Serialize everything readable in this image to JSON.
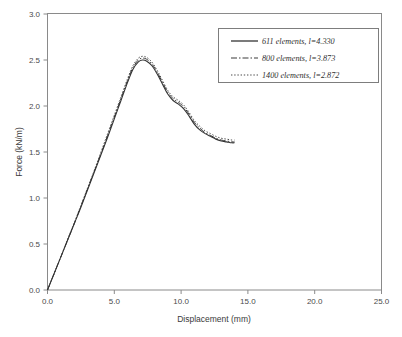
{
  "chart_data": {
    "type": "line",
    "title": "",
    "xlabel": "Displacement (mm)",
    "ylabel": "Force (kN/m)",
    "xlim": [
      0.0,
      25.0
    ],
    "ylim": [
      0.0,
      3.0
    ],
    "xticks": [
      "0.0",
      "5.0",
      "10.0",
      "15.0",
      "20.0",
      "25.0"
    ],
    "yticks": [
      "0.0",
      "0.5",
      "1.0",
      "1.5",
      "2.0",
      "2.5",
      "3.0"
    ],
    "xtick_values": [
      0.0,
      5.0,
      10.0,
      15.0,
      20.0,
      25.0
    ],
    "ytick_values": [
      0.0,
      0.5,
      1.0,
      1.5,
      2.0,
      2.5,
      3.0
    ],
    "grid": false,
    "legend_position": "top-right",
    "series": [
      {
        "name": "611 elements,  l=4.330",
        "style": "solid",
        "x": [
          0.0,
          0.5,
          1.0,
          1.5,
          2.0,
          2.5,
          3.0,
          3.5,
          4.0,
          4.5,
          5.0,
          5.5,
          6.0,
          6.4,
          6.8,
          7.1,
          7.4,
          7.8,
          8.2,
          8.6,
          9.0,
          9.4,
          9.8,
          10.2,
          10.6,
          11.0,
          11.4,
          11.8,
          12.2,
          12.6,
          13.0,
          13.4,
          13.8,
          14.0
        ],
        "y": [
          0.0,
          0.18,
          0.36,
          0.54,
          0.72,
          0.9,
          1.09,
          1.28,
          1.47,
          1.66,
          1.86,
          2.06,
          2.26,
          2.4,
          2.48,
          2.5,
          2.49,
          2.44,
          2.35,
          2.24,
          2.13,
          2.06,
          2.02,
          1.97,
          1.89,
          1.8,
          1.74,
          1.7,
          1.67,
          1.64,
          1.62,
          1.61,
          1.6,
          1.6
        ]
      },
      {
        "name": "800 elements,  l=3.873",
        "style": "dash-dot",
        "x": [
          0.0,
          0.5,
          1.0,
          1.5,
          2.0,
          2.5,
          3.0,
          3.5,
          4.0,
          4.5,
          5.0,
          5.5,
          6.0,
          6.4,
          6.8,
          7.1,
          7.4,
          7.8,
          8.2,
          8.6,
          9.0,
          9.4,
          9.8,
          10.2,
          10.6,
          11.0,
          11.4,
          11.8,
          12.2,
          12.6,
          13.0,
          13.4,
          13.8,
          14.0
        ],
        "y": [
          0.0,
          0.18,
          0.36,
          0.54,
          0.72,
          0.91,
          1.1,
          1.29,
          1.48,
          1.68,
          1.88,
          2.08,
          2.28,
          2.42,
          2.5,
          2.52,
          2.51,
          2.46,
          2.37,
          2.26,
          2.15,
          2.08,
          2.04,
          1.99,
          1.91,
          1.82,
          1.76,
          1.71,
          1.68,
          1.65,
          1.63,
          1.62,
          1.61,
          1.61
        ]
      },
      {
        "name": "1400 elements,  l=2.872",
        "style": "dotted",
        "x": [
          0.0,
          0.5,
          1.0,
          1.5,
          2.0,
          2.5,
          3.0,
          3.5,
          4.0,
          4.5,
          5.0,
          5.5,
          6.0,
          6.4,
          6.8,
          7.1,
          7.4,
          7.8,
          8.2,
          8.6,
          9.0,
          9.4,
          9.8,
          10.2,
          10.6,
          11.0,
          11.4,
          11.8,
          12.2,
          12.6,
          13.0,
          13.4,
          13.8,
          14.0
        ],
        "y": [
          0.0,
          0.18,
          0.36,
          0.55,
          0.73,
          0.92,
          1.11,
          1.3,
          1.5,
          1.7,
          1.9,
          2.1,
          2.3,
          2.44,
          2.52,
          2.54,
          2.53,
          2.48,
          2.39,
          2.28,
          2.17,
          2.1,
          2.06,
          2.01,
          1.93,
          1.84,
          1.78,
          1.73,
          1.7,
          1.67,
          1.65,
          1.64,
          1.63,
          1.63
        ]
      }
    ]
  },
  "legend": {
    "entries": [
      {
        "label": "611 elements,  l=4.330",
        "style": "solid"
      },
      {
        "label": "800 elements,  l=3.873",
        "style": "dash-dot"
      },
      {
        "label": "1400 elements,  l=2.872",
        "style": "dotted"
      }
    ]
  },
  "colors": {
    "axis": "#8a8a8a",
    "curve": "#333333",
    "text": "#3a3a3a",
    "background": "#ffffff"
  }
}
